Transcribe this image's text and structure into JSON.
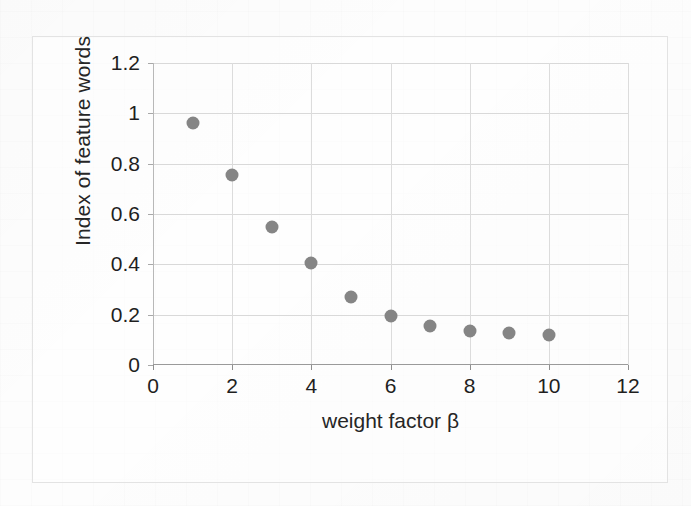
{
  "chart_data": {
    "type": "scatter",
    "title": "",
    "xlabel": "weight factor β",
    "ylabel": "Index of feature words",
    "xlim": [
      0,
      12
    ],
    "ylim": [
      0,
      1.2
    ],
    "x_ticks": [
      "0",
      "2",
      "4",
      "6",
      "8",
      "10",
      "12"
    ],
    "x_tick_values": [
      0,
      2,
      4,
      6,
      8,
      10,
      12
    ],
    "y_ticks": [
      "0",
      "0.2",
      "0.4",
      "0.6",
      "0.8",
      "1",
      "1.2"
    ],
    "y_tick_values": [
      0,
      0.2,
      0.4,
      0.6,
      0.8,
      1,
      1.2
    ],
    "grid": true,
    "legend": "none",
    "marker_color": "#858585",
    "x": [
      1,
      2,
      3,
      4,
      5,
      6,
      7,
      8,
      9,
      10
    ],
    "values": [
      0.96,
      0.755,
      0.55,
      0.405,
      0.27,
      0.195,
      0.155,
      0.135,
      0.128,
      0.118
    ],
    "series": [
      {
        "name": "Index of feature words",
        "points": [
          {
            "x": 1,
            "y": 0.96
          },
          {
            "x": 2,
            "y": 0.755
          },
          {
            "x": 3,
            "y": 0.55
          },
          {
            "x": 4,
            "y": 0.405
          },
          {
            "x": 5,
            "y": 0.27
          },
          {
            "x": 6,
            "y": 0.195
          },
          {
            "x": 7,
            "y": 0.155
          },
          {
            "x": 8,
            "y": 0.135
          },
          {
            "x": 9,
            "y": 0.128
          },
          {
            "x": 10,
            "y": 0.118
          }
        ]
      }
    ]
  },
  "colors": {
    "marker": "#858585",
    "gridline": "#d9d9d9",
    "axis": "#9a9a9a",
    "frame": "#e3e3e3",
    "text": "#1f1f1f",
    "background": "#fdfdfd"
  }
}
